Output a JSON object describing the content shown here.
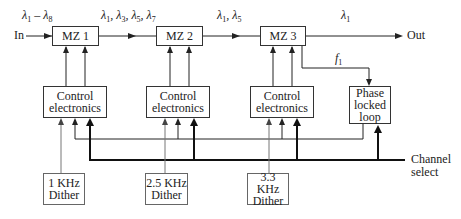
{
  "diagram": {
    "type": "block-diagram",
    "title": "",
    "input": {
      "label": "In",
      "wavelengths": "λ1 – λ8"
    },
    "output": {
      "label": "Out",
      "wavelengths": "λ1"
    },
    "stages": [
      {
        "id": "mz1",
        "label": "MZ 1",
        "output_wavelengths": "λ1, λ3, λ5, λ7"
      },
      {
        "id": "mz2",
        "label": "MZ 2",
        "output_wavelengths": "λ1, λ5"
      },
      {
        "id": "mz3",
        "label": "MZ 3",
        "output_wavelengths": "λ1"
      }
    ],
    "control": [
      {
        "id": "ce1",
        "line1": "Control",
        "line2": "electronics"
      },
      {
        "id": "ce2",
        "line1": "Control",
        "line2": "electronics"
      },
      {
        "id": "ce3",
        "line1": "Control",
        "line2": "electronics"
      }
    ],
    "pll": {
      "line1": "Phase",
      "line2": "locked",
      "line3": "loop",
      "input_label": "f1"
    },
    "dithers": [
      {
        "id": "d1",
        "line1": "1 KHz",
        "line2": "Dither"
      },
      {
        "id": "d2",
        "line1": "2.5 KHz",
        "line2": "Dither"
      },
      {
        "id": "d3",
        "line1": "3.3 KHz",
        "line2": "Dither"
      }
    ],
    "channel_select": {
      "line1": "Channel",
      "line2": "select"
    }
  },
  "labels": {
    "in": "In",
    "out": "Out",
    "in_lambda_a": "λ",
    "in_lambda_a_sub": "1",
    "in_dash": " – ",
    "in_lambda_b": "λ",
    "in_lambda_b_sub": "8",
    "mz1_out": [
      "1",
      "3",
      "5",
      "7"
    ],
    "mz2_out": [
      "1",
      "5"
    ],
    "mz3_out": [
      "1"
    ],
    "f": "f",
    "f_sub": "1"
  }
}
